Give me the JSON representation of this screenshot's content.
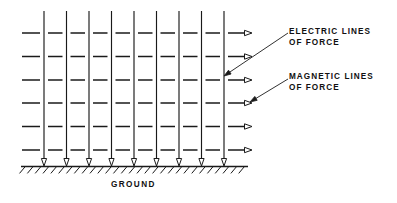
{
  "diagram": {
    "background_color": "#ffffff",
    "ink_color": "#1a1a1a",
    "labels": {
      "electric_line1": "ELECTRIC LINES",
      "electric_line2": "OF FORCE",
      "magnetic_line1": "MAGNETIC LINES",
      "magnetic_line2": "OF FORCE",
      "ground": "GROUND"
    },
    "vertical_lines": {
      "name": "electric-lines-of-force",
      "count": 9,
      "x_positions": [
        44,
        66.5,
        89,
        111.5,
        134,
        156.5,
        179,
        201.5,
        224
      ],
      "y_top": 11,
      "y_tip": 166,
      "arrow_direction": "down"
    },
    "horizontal_dash_rows": {
      "name": "magnetic-lines-of-force",
      "count": 6,
      "y_positions": [
        33,
        56.5,
        80,
        103,
        126.5,
        150
      ],
      "x_start": 22,
      "x_arrow_tip": 252,
      "arrow_direction": "right"
    },
    "ground": {
      "y": 166.5,
      "x_start": 21,
      "x_end": 248,
      "hatch_count": 29,
      "hatch_length": 9,
      "hatch_angle_deg": 50
    },
    "leaders": [
      {
        "name": "electric-leader",
        "from_x": 288,
        "from_y": 33,
        "to_x": 224,
        "to_y": 76
      },
      {
        "name": "magnetic-leader",
        "from_x": 288,
        "from_y": 79,
        "to_x": 250,
        "to_y": 102
      }
    ]
  }
}
